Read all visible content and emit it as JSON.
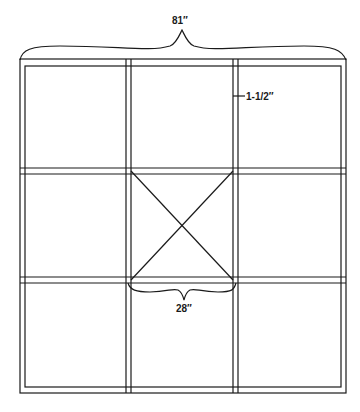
{
  "diagram": {
    "type": "window-frame grid (3x3 panes)",
    "dimensions": {
      "overall_width": "81″",
      "frame_member_width": "1-1/2″",
      "center_pane_width": "28″"
    },
    "grid": {
      "rows": 3,
      "columns": 3
    },
    "center_pane_marking": "X (diagonal cross bracing)",
    "colors": {
      "line": "#1a1a1a",
      "background": "#ffffff"
    }
  }
}
